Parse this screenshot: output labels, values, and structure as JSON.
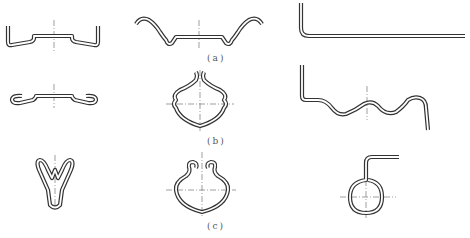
{
  "figure": {
    "labels": {
      "a": "(a)",
      "b": "(b)",
      "c": "(c)"
    },
    "rows": [
      {
        "row": "a",
        "parts": [
          "flat-channel-clip",
          "wavy-channel-clip",
          "l-shaped-rod"
        ]
      },
      {
        "row": "b",
        "parts": [
          "curled-edge-clip",
          "diamond-loop-clip",
          "wave-spring-bracket"
        ]
      },
      {
        "row": "c",
        "parts": [
          "v-shaped-clip",
          "curled-diamond-clip",
          "ring-hook"
        ]
      }
    ],
    "colors": {
      "stroke": "#333333",
      "centerline": "#777777",
      "background": "#ffffff",
      "label": "#555555"
    }
  }
}
